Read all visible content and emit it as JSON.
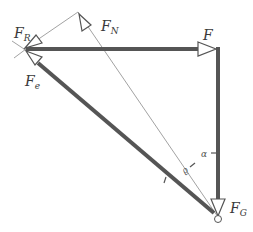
{
  "diagram": {
    "colors": {
      "thick_line": "#555555",
      "thin_line": "#8a8a8a",
      "text": "#3a3a3a",
      "background": "#ffffff"
    },
    "labels": {
      "F_R": {
        "main": "F",
        "sub": "R"
      },
      "F_N": {
        "main": "F",
        "sub": "N"
      },
      "F": {
        "main": "F"
      },
      "F_e": {
        "main": "F",
        "sub": "e"
      },
      "F_G": {
        "main": "F",
        "sub": "G"
      },
      "alpha": "α",
      "rho": "ϱ"
    },
    "points": {
      "left_vertex": [
        24,
        49
      ],
      "top_vertex": [
        78,
        12
      ],
      "right_corner": [
        217,
        49
      ],
      "bottom_vertex": [
        218,
        217
      ]
    }
  }
}
